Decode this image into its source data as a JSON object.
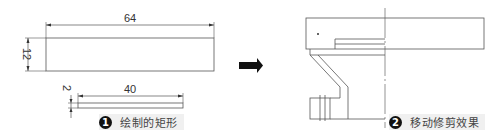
{
  "step1": {
    "badge": "1",
    "caption": "绘制的矩形",
    "rect_large": {
      "width_label": "64",
      "height_label": "12"
    },
    "rect_small": {
      "width_label": "40",
      "height_label": "2"
    }
  },
  "arrow": {
    "icon": "right-arrow-icon"
  },
  "step2": {
    "badge": "2",
    "caption": "移动修剪效果"
  },
  "colors": {
    "line": "#555555",
    "text": "#333333",
    "caption_bg": "#f0f0f0",
    "badge_bg": "#111111"
  }
}
